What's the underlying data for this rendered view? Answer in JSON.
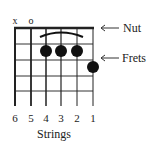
{
  "diagram": {
    "type": "guitar-chord-chart",
    "open_muted": {
      "string6": "x",
      "string5": "o"
    },
    "annotations": {
      "nut": "Nut",
      "frets": "Frets"
    },
    "string_labels": [
      "6",
      "5",
      "4",
      "3",
      "2",
      "1"
    ],
    "axis_label": "Strings",
    "barre": {
      "strings": [
        4,
        3,
        2
      ],
      "fret": 1
    },
    "dots": [
      {
        "string": 4,
        "fret": 1
      },
      {
        "string": 3,
        "fret": 1
      },
      {
        "string": 2,
        "fret": 1
      },
      {
        "string": 1,
        "fret": 2
      }
    ],
    "fret_count": 5,
    "colors": {
      "line": "#222222",
      "dot": "#111111",
      "background": "#ffffff"
    }
  }
}
